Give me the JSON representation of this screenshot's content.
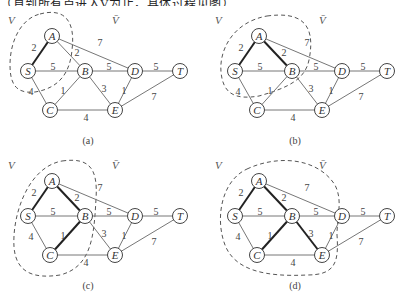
{
  "header": {
    "text": "（直到所有点进入V为止，具体过程见图）"
  },
  "graph": {
    "nodes": [
      {
        "id": "A",
        "x": 52,
        "y": 26
      },
      {
        "id": "S",
        "x": 28,
        "y": 61
      },
      {
        "id": "B",
        "x": 85,
        "y": 61
      },
      {
        "id": "D",
        "x": 135,
        "y": 61
      },
      {
        "id": "T",
        "x": 180,
        "y": 61
      },
      {
        "id": "C",
        "x": 50,
        "y": 100
      },
      {
        "id": "E",
        "x": 115,
        "y": 100
      }
    ],
    "edges": [
      {
        "from": "S",
        "to": "A",
        "w": "2",
        "lx": 34,
        "ly": 37
      },
      {
        "from": "A",
        "to": "B",
        "w": "2",
        "lx": 77,
        "ly": 42
      },
      {
        "from": "A",
        "to": "D",
        "w": "7",
        "lx": 100,
        "ly": 32
      },
      {
        "from": "S",
        "to": "B",
        "w": "5",
        "lx": 53,
        "ly": 56
      },
      {
        "from": "B",
        "to": "D",
        "w": "5",
        "lx": 109,
        "ly": 56
      },
      {
        "from": "D",
        "to": "T",
        "w": "5",
        "lx": 156,
        "ly": 56
      },
      {
        "from": "S",
        "to": "C",
        "w": "4",
        "lx": 31,
        "ly": 81
      },
      {
        "from": "B",
        "to": "C",
        "w": "1",
        "lx": 63,
        "ly": 80
      },
      {
        "from": "B",
        "to": "E",
        "w": "3",
        "lx": 104,
        "ly": 78
      },
      {
        "from": "D",
        "to": "E",
        "w": "1",
        "lx": 124,
        "ly": 80
      },
      {
        "from": "E",
        "to": "T",
        "w": "7",
        "lx": 154,
        "ly": 86
      },
      {
        "from": "C",
        "to": "E",
        "w": "4",
        "lx": 86,
        "ly": 107
      }
    ]
  },
  "panels": [
    {
      "id": "a",
      "caption": "(a)",
      "set_label": "V",
      "complement_label": "V̄",
      "bold_edges": [
        "S-A"
      ],
      "cut_path": "M 40 4 C 62 -2 76 8 72 40 C 70 62 60 78 35 82 C 16 84 10 74 10 55 C 10 30 22 8 40 4 Z"
    },
    {
      "id": "b",
      "caption": "(b)",
      "set_label": "V",
      "complement_label": "V̄",
      "bold_edges": [
        "S-A",
        "A-B"
      ],
      "cut_path": "M 60 6 C 90 2 110 10 102 50 C 98 70 80 78 52 86 C 28 90 16 84 14 62 C 12 40 26 12 60 6 Z"
    },
    {
      "id": "c",
      "caption": "(c)",
      "set_label": "V",
      "complement_label": "V̄",
      "bold_edges": [
        "S-A",
        "A-B",
        "B-C"
      ],
      "cut_path": "M 62 6 C 90 2 98 14 96 44 C 94 80 92 112 60 120 C 34 124 16 118 14 92 C 12 60 28 12 62 6 Z"
    },
    {
      "id": "d",
      "caption": "(d)",
      "set_label": "V",
      "complement_label": "V̄",
      "bold_edges": [
        "S-A",
        "A-B",
        "B-C",
        "B-E"
      ],
      "cut_path": "M 40 14 C 70 0 110 2 128 30 C 136 46 130 60 130 80 C 132 108 128 120 100 120 C 60 122 28 116 18 90 C 8 64 14 26 40 14 Z"
    }
  ],
  "layout": {
    "offsets": {
      "a": [
        0,
        10
      ],
      "b": [
        207,
        10
      ],
      "c": [
        0,
        155
      ],
      "d": [
        207,
        155
      ]
    }
  }
}
